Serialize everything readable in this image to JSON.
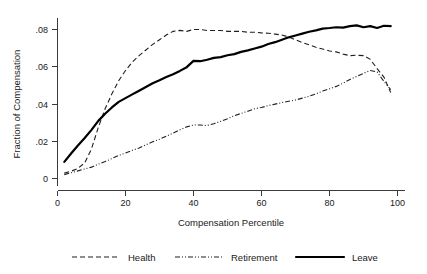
{
  "chart_data": {
    "type": "line",
    "title": "",
    "xlabel": "Compensation Percentile",
    "ylabel": "Fraction of Compensation",
    "xlim": [
      0,
      100
    ],
    "ylim": [
      0,
      0.088
    ],
    "grid": false,
    "legend_position": "bottom",
    "xticks": [
      "0",
      "20",
      "40",
      "60",
      "80",
      "100"
    ],
    "xtick_values": [
      0,
      20,
      40,
      60,
      80,
      100
    ],
    "yticks": [
      "0",
      ".02",
      ".04",
      ".06",
      ".08"
    ],
    "ytick_values": [
      0,
      0.02,
      0.04,
      0.06,
      0.08
    ],
    "x": [
      2,
      4,
      6,
      8,
      10,
      12,
      14,
      16,
      18,
      20,
      22,
      24,
      26,
      28,
      30,
      32,
      34,
      36,
      38,
      40,
      42,
      44,
      46,
      48,
      50,
      52,
      54,
      56,
      58,
      60,
      62,
      64,
      66,
      68,
      70,
      72,
      74,
      76,
      78,
      80,
      82,
      84,
      86,
      88,
      90,
      92,
      94,
      96,
      98
    ],
    "series": [
      {
        "name": "Health",
        "style": "dashed",
        "values": [
          0.003,
          0.004,
          0.0055,
          0.0085,
          0.016,
          0.0275,
          0.0375,
          0.0455,
          0.0525,
          0.058,
          0.0625,
          0.066,
          0.069,
          0.072,
          0.0745,
          0.077,
          0.079,
          0.0795,
          0.079,
          0.08,
          0.08,
          0.0795,
          0.0795,
          0.0795,
          0.079,
          0.079,
          0.079,
          0.0785,
          0.0785,
          0.0782,
          0.078,
          0.0775,
          0.077,
          0.076,
          0.0745,
          0.073,
          0.0718,
          0.0705,
          0.0695,
          0.0685,
          0.068,
          0.0668,
          0.066,
          0.0662,
          0.066,
          0.064,
          0.059,
          0.0545,
          0.0462
        ]
      },
      {
        "name": "Retirement",
        "style": "dash-dot-dot",
        "values": [
          0.0022,
          0.0032,
          0.0042,
          0.0052,
          0.0062,
          0.0078,
          0.0092,
          0.0108,
          0.0125,
          0.0138,
          0.0152,
          0.0165,
          0.0182,
          0.0198,
          0.0212,
          0.0228,
          0.0245,
          0.0262,
          0.0278,
          0.0288,
          0.0288,
          0.0285,
          0.0295,
          0.0308,
          0.0322,
          0.0338,
          0.035,
          0.0362,
          0.0375,
          0.0382,
          0.0392,
          0.04,
          0.0408,
          0.0415,
          0.0422,
          0.0432,
          0.0442,
          0.0455,
          0.047,
          0.0482,
          0.0495,
          0.0512,
          0.0532,
          0.0548,
          0.0565,
          0.058,
          0.0572,
          0.0522,
          0.0478
        ]
      },
      {
        "name": "Leave",
        "style": "solid",
        "values": [
          0.009,
          0.0135,
          0.0178,
          0.0218,
          0.0262,
          0.031,
          0.0348,
          0.0382,
          0.0412,
          0.0432,
          0.0452,
          0.0472,
          0.0492,
          0.0512,
          0.0528,
          0.0545,
          0.056,
          0.0578,
          0.0598,
          0.0632,
          0.063,
          0.0638,
          0.0648,
          0.0652,
          0.0662,
          0.0668,
          0.068,
          0.0688,
          0.0698,
          0.0708,
          0.0722,
          0.0732,
          0.0745,
          0.0758,
          0.0768,
          0.0778,
          0.0788,
          0.0795,
          0.0805,
          0.0808,
          0.0812,
          0.081,
          0.0818,
          0.0822,
          0.0812,
          0.0818,
          0.0808,
          0.082,
          0.0818
        ]
      }
    ]
  },
  "legend": {
    "items": [
      {
        "label": "Health",
        "style": "dashed"
      },
      {
        "label": "Retirement",
        "style": "dash-dot-dot"
      },
      {
        "label": "Leave",
        "style": "solid"
      }
    ]
  },
  "colors": {
    "line": "#1f1f1f",
    "axis": "#3a3a3a",
    "background": "#ffffff"
  }
}
